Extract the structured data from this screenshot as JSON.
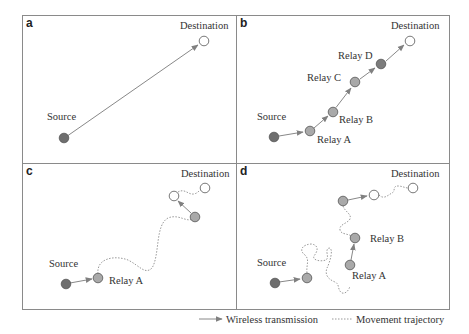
{
  "colors": {
    "source": "#6e6e6e",
    "relay": "#a9a9a9",
    "relay_dark": "#7c7c7c",
    "destination": "#ffffff",
    "frame": "#8a8a8a",
    "link": "#888888",
    "trajectory": "#999999"
  },
  "panels": [
    {
      "id": "a",
      "letter": "a",
      "labels": {
        "source": "Source",
        "destination": "Destination"
      }
    },
    {
      "id": "b",
      "letter": "b",
      "labels": {
        "source": "Source",
        "relay_a": "Relay A",
        "relay_b": "Relay B",
        "relay_c": "Relay C",
        "relay_d": "Relay D",
        "destination": "Destination"
      }
    },
    {
      "id": "c",
      "letter": "c",
      "labels": {
        "source": "Source",
        "relay_a": "Relay A",
        "destination": "Destination"
      }
    },
    {
      "id": "d",
      "letter": "d",
      "labels": {
        "source": "Source",
        "relay_a": "Relay A",
        "relay_b": "Relay B",
        "destination": "Destination"
      }
    }
  ],
  "legend": {
    "wireless": "Wireless transmission",
    "movement": "Movement trajectory"
  }
}
